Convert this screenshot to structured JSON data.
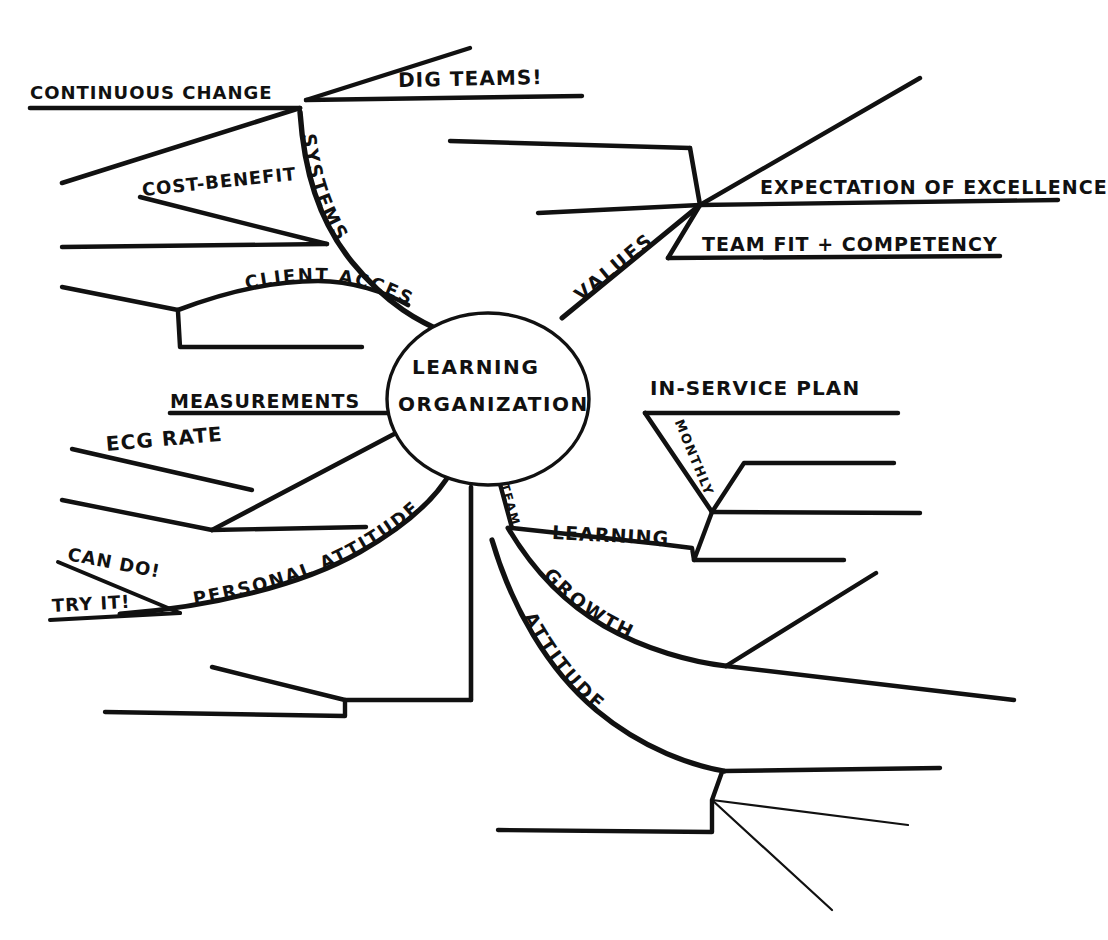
{
  "diagram": {
    "type": "hand-drawn mind map",
    "ink_color": "#111111",
    "background_color": "#ffffff",
    "center": {
      "line1": "LEARNING",
      "line2": "ORGANIZATION"
    },
    "main_branches": [
      {
        "label": "SYSTEMS",
        "direction": "upper-left",
        "children": [
          {
            "label": "CONTINUOUS CHANGE"
          },
          {
            "label": "DIG TEAMS!"
          },
          {
            "label": "COST-BENEFIT"
          },
          {
            "label": "CLIENT ACCESS"
          }
        ]
      },
      {
        "label": "VALUES",
        "direction": "upper-right",
        "children": [
          {
            "label": "EXPECTATION OF EXCELLENCE"
          },
          {
            "label": "TEAM FIT + COMPETENCY"
          },
          {
            "label": ""
          }
        ]
      },
      {
        "label": "MEASUREMENTS",
        "direction": "left",
        "children": [
          {
            "label": "ECG RATE"
          },
          {
            "label": ""
          }
        ]
      },
      {
        "label": "PERSONAL ATTITUDE",
        "direction": "lower-left",
        "children": [
          {
            "label": "CAN DO!"
          },
          {
            "label": "TRY IT!"
          }
        ]
      },
      {
        "label": "TEAM",
        "direction": "lower-right",
        "children": [
          {
            "label": "LEARNING"
          },
          {
            "label": "GROWTH"
          },
          {
            "label": "ATTITUDE"
          }
        ]
      },
      {
        "label": "IN-SERVICE PLAN",
        "direction": "right",
        "children": [
          {
            "label": "MONTHLY"
          }
        ]
      },
      {
        "label": "",
        "direction": "down",
        "children": []
      }
    ],
    "labels": {
      "continuous_change": "CONTINUOUS CHANGE",
      "dig_teams": "DIG TEAMS!",
      "systems": "SYSTEMS",
      "cost_benefit": "COST-BENEFIT",
      "client_access": "CLIENT ACCESS",
      "values": "VALUES",
      "expectation_of_excellence": "EXPECTATION OF EXCELLENCE",
      "team_fit_competency": "TEAM FIT + COMPETENCY",
      "measurements": "MEASUREMENTS",
      "ecg_rate": "ECG RATE",
      "can_do": "CAN DO!",
      "try_it": "TRY IT!",
      "personal_attitude": "PERSONAL ATTITUDE",
      "in_service_plan": "IN-SERVICE PLAN",
      "monthly": "MONTHLY",
      "team": "TEAM",
      "learning": "LEARNING",
      "growth": "GROWTH",
      "attitude": "ATTITUDE"
    }
  }
}
